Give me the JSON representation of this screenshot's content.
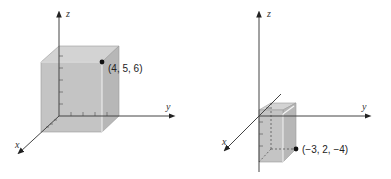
{
  "figures": [
    {
      "id": "left",
      "axes": {
        "x": "x",
        "y": "y",
        "z": "z"
      },
      "point": {
        "label": "(4, 5, 6)",
        "coords": [
          4,
          5,
          6
        ]
      },
      "box_dims": {
        "x": 4,
        "y": 5,
        "z": 6
      }
    },
    {
      "id": "right",
      "axes": {
        "x": "x",
        "y": "y",
        "z": "z"
      },
      "point": {
        "label": "(−3, 2, −4)",
        "coords": [
          -3,
          2,
          -4
        ]
      },
      "box_dims": {
        "x": -3,
        "y": 2,
        "z": -4
      }
    }
  ],
  "colors": {
    "box_fill": "#c2c2c2",
    "box_top": "#d6d6d6",
    "box_side": "#b5b5b5",
    "axis": "#444444",
    "point": "#111111"
  }
}
